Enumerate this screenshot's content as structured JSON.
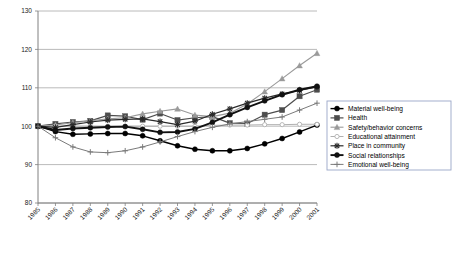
{
  "chart_data": {
    "type": "line",
    "title": "",
    "subtitle": "",
    "xlabel": "",
    "ylabel": "",
    "xlim": [
      1985,
      2001
    ],
    "ylim": [
      80,
      130
    ],
    "yticks": [
      80,
      90,
      100,
      110,
      120,
      130
    ],
    "grid": true,
    "grid_axis": "y",
    "legend_position": "right-middle",
    "index_base_year": 1985,
    "index_base_value": 100,
    "categories": [
      1985,
      1986,
      1987,
      1988,
      1989,
      1990,
      1991,
      1992,
      1993,
      1994,
      1995,
      1996,
      1997,
      1998,
      1999,
      2000,
      2001
    ],
    "xtick_labels": [
      "1985",
      "1986",
      "1987",
      "1988",
      "1989",
      "1990",
      "1991",
      "1992",
      "1993",
      "1994",
      "1995",
      "1996",
      "1997",
      "1998",
      "1999",
      "2000",
      "2001"
    ],
    "series": [
      {
        "name": "Material well-being",
        "marker": "filled-circle",
        "color": "#000000",
        "line_width": 1.4,
        "values": [
          100.0,
          98.6,
          97.9,
          98.0,
          98.1,
          98.1,
          97.5,
          96.2,
          94.9,
          94.0,
          93.6,
          93.6,
          94.2,
          95.4,
          96.8,
          98.5,
          100.3
        ]
      },
      {
        "name": "Health",
        "marker": "filled-square",
        "color": "#4d4d4d",
        "line_width": 1.2,
        "values": [
          100.0,
          100.6,
          101.1,
          101.4,
          102.8,
          102.6,
          101.7,
          103.3,
          101.6,
          102.2,
          102.5,
          100.8,
          100.7,
          103.0,
          104.2,
          107.8,
          109.5
        ]
      },
      {
        "name": "Safety/behavior concerns",
        "marker": "filled-triangle",
        "color": "#9a9a9a",
        "line_width": 1.1,
        "values": [
          100.0,
          100.3,
          100.9,
          101.4,
          101.9,
          102.2,
          103.2,
          103.9,
          104.5,
          102.9,
          102.5,
          103.4,
          105.8,
          109.0,
          112.4,
          115.8,
          119.0
        ]
      },
      {
        "name": "Educational attainment",
        "marker": "open-circle",
        "color": "#b0b0b0",
        "line_width": 1.0,
        "values": [
          100.0,
          100.0,
          100.0,
          100.0,
          100.0,
          100.0,
          100.0,
          100.0,
          100.0,
          100.0,
          100.2,
          100.3,
          100.3,
          100.4,
          100.4,
          100.5,
          100.5
        ]
      },
      {
        "name": "Place in community",
        "marker": "star",
        "color": "#2b2b2b",
        "line_width": 1.2,
        "values": [
          100.0,
          99.7,
          100.4,
          101.1,
          101.6,
          101.8,
          101.9,
          101.2,
          100.4,
          101.3,
          103.1,
          104.5,
          106.0,
          107.3,
          108.4,
          109.3,
          110.2
        ]
      },
      {
        "name": "Social relationships",
        "marker": "filled-circle",
        "color": "#111111",
        "line_width": 1.9,
        "values": [
          100.0,
          99.0,
          99.4,
          99.6,
          99.8,
          99.9,
          99.2,
          98.4,
          98.5,
          99.3,
          101.0,
          103.0,
          104.9,
          106.6,
          108.2,
          109.5,
          110.4
        ]
      },
      {
        "name": "Emotional well-being",
        "marker": "plus",
        "color": "#7a7a7a",
        "line_width": 1.0,
        "values": [
          100.0,
          97.0,
          94.6,
          93.3,
          93.1,
          93.6,
          94.6,
          95.9,
          97.3,
          98.6,
          99.7,
          100.6,
          101.2,
          101.8,
          102.4,
          104.2,
          106.0
        ]
      }
    ]
  },
  "legend": {
    "items": [
      {
        "label": "Material well-being"
      },
      {
        "label": "Health"
      },
      {
        "label": "Safety/behavior concerns"
      },
      {
        "label": "Educational attainment"
      },
      {
        "label": "Place in community"
      },
      {
        "label": "Social relationships"
      },
      {
        "label": "Emotional well-being"
      }
    ]
  }
}
